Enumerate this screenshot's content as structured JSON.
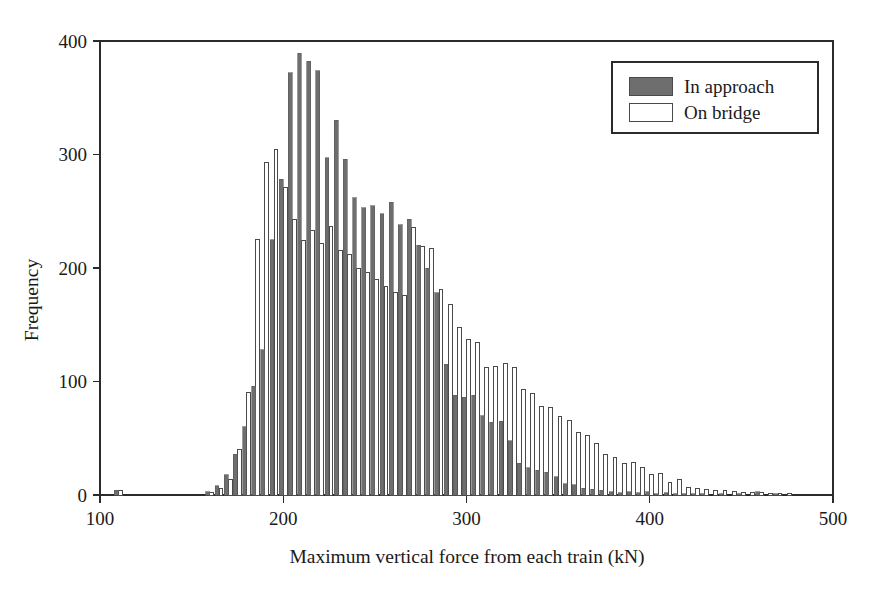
{
  "chart_data": {
    "type": "bar",
    "subtype": "histogram-grouped",
    "title": "",
    "subtitle": "",
    "xlabel": "Maximum vertical force from each train (kN)",
    "ylabel": "Frequency",
    "xlim": [
      100,
      500
    ],
    "ylim": [
      0,
      400
    ],
    "xticks": [
      100,
      200,
      300,
      400,
      500
    ],
    "yticks": [
      0,
      100,
      200,
      300,
      400
    ],
    "xtick_labels": [
      "100",
      "200",
      "300",
      "400",
      "500"
    ],
    "ytick_labels": [
      "0",
      "100",
      "200",
      "300",
      "400"
    ],
    "grid": false,
    "legend_position": "top-right",
    "bin_width": 5,
    "bin_centers": [
      110,
      115,
      120,
      125,
      130,
      135,
      140,
      145,
      150,
      155,
      160,
      165,
      170,
      175,
      180,
      185,
      190,
      195,
      200,
      205,
      210,
      215,
      220,
      225,
      230,
      235,
      240,
      245,
      250,
      255,
      260,
      265,
      270,
      275,
      280,
      285,
      290,
      295,
      300,
      305,
      310,
      315,
      320,
      325,
      330,
      335,
      340,
      345,
      350,
      355,
      360,
      365,
      370,
      375,
      380,
      385,
      390,
      395,
      400,
      405,
      410,
      415,
      420,
      425,
      430,
      435,
      440,
      445,
      450,
      455,
      460,
      465,
      470,
      475,
      480,
      485,
      490
    ],
    "series": [
      {
        "name": "In approach",
        "color": "#6e6e6e",
        "edge_color": "#5a5a5a",
        "values": [
          4,
          0,
          0,
          0,
          0,
          0,
          0,
          0,
          0,
          0,
          3,
          8,
          18,
          36,
          60,
          96,
          128,
          225,
          278,
          372,
          389,
          382,
          374,
          297,
          330,
          296,
          262,
          253,
          255,
          248,
          258,
          238,
          243,
          220,
          200,
          178,
          115,
          88,
          86,
          88,
          70,
          64,
          65,
          48,
          28,
          24,
          22,
          20,
          16,
          10,
          9,
          6,
          5,
          4,
          3,
          2,
          3,
          2,
          3,
          1,
          2,
          1,
          1,
          1,
          1,
          0,
          1,
          0,
          1,
          0,
          3,
          0,
          1,
          0,
          0,
          0,
          0
        ]
      },
      {
        "name": "On bridge",
        "color": "#ffffff",
        "edge_color": "#4a4a4a",
        "values": [
          4,
          0,
          0,
          0,
          0,
          0,
          0,
          0,
          0,
          0,
          2,
          6,
          14,
          40,
          90,
          225,
          293,
          304,
          271,
          243,
          224,
          233,
          222,
          237,
          215,
          212,
          200,
          196,
          190,
          184,
          178,
          176,
          236,
          219,
          217,
          181,
          168,
          148,
          137,
          134,
          112,
          113,
          116,
          112,
          93,
          89,
          78,
          77,
          69,
          66,
          55,
          52,
          45,
          36,
          33,
          28,
          29,
          24,
          18,
          19,
          11,
          14,
          7,
          6,
          5,
          4,
          4,
          3,
          2,
          2,
          2,
          1,
          1,
          1,
          0,
          0,
          0
        ]
      }
    ],
    "legend": [
      {
        "label": "In approach",
        "swatch": "#6e6e6e",
        "filled": true
      },
      {
        "label": "On bridge",
        "swatch": "#ffffff",
        "filled": false
      }
    ]
  },
  "axes": {
    "y_title": "Frequency",
    "x_title": "Maximum vertical force from each train (kN)"
  }
}
